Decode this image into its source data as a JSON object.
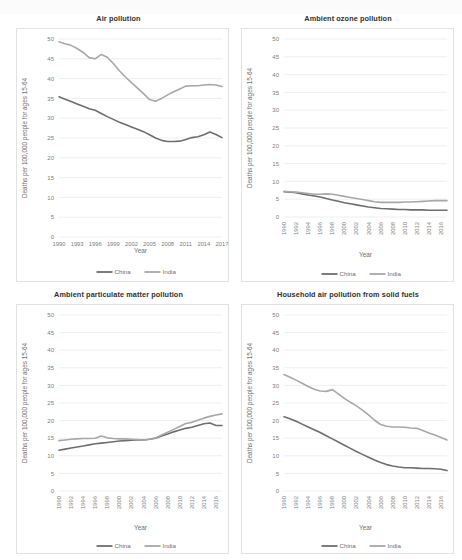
{
  "figure": {
    "legend": [
      {
        "label": "China",
        "color": "#6e6e6e"
      },
      {
        "label": "India",
        "color": "#a8a8a8"
      }
    ],
    "y_axis_title": "Deaths per 100,000 people for ages 15-64",
    "x_axis_title": "Year",
    "y_ticks": [
      "0",
      "5",
      "10",
      "15",
      "20",
      "25",
      "30",
      "35",
      "40",
      "45",
      "50"
    ]
  },
  "chart_data": [
    {
      "type": "line",
      "title": "Air pollution",
      "xlabel": "Year",
      "ylabel": "Deaths per 100,000 people for ages 15-64",
      "ylim": [
        0,
        50
      ],
      "grid": true,
      "legend_position": "bottom",
      "tick_labels": [
        "1990",
        "1993",
        "1996",
        "1999",
        "2002",
        "2005",
        "2008",
        "2011",
        "2014",
        "2017"
      ],
      "tick_rotation": 0,
      "x": [
        1990,
        1991,
        1992,
        1993,
        1994,
        1995,
        1996,
        1997,
        1998,
        1999,
        2000,
        2001,
        2002,
        2003,
        2004,
        2005,
        2006,
        2007,
        2008,
        2009,
        2010,
        2011,
        2012,
        2013,
        2014,
        2015,
        2016,
        2017
      ],
      "series": [
        {
          "name": "China",
          "color": "#6e6e6e",
          "values": [
            35.4,
            34.8,
            34.2,
            33.6,
            33.0,
            32.4,
            32.0,
            31.2,
            30.4,
            29.7,
            29.0,
            28.4,
            27.8,
            27.2,
            26.6,
            25.8,
            25.0,
            24.4,
            24.1,
            24.1,
            24.2,
            24.6,
            25.1,
            25.3,
            25.8,
            26.5,
            25.9,
            25.1
          ]
        },
        {
          "name": "India",
          "color": "#a8a8a8",
          "values": [
            49.3,
            48.8,
            48.4,
            47.6,
            46.6,
            45.3,
            45.0,
            46.1,
            45.4,
            43.8,
            42.0,
            40.4,
            39.0,
            37.6,
            36.2,
            34.7,
            34.3,
            35.0,
            35.9,
            36.7,
            37.4,
            38.1,
            38.2,
            38.2,
            38.4,
            38.5,
            38.4,
            38.0
          ]
        }
      ]
    },
    {
      "type": "line",
      "title": "Ambient ozone pollution",
      "xlabel": "Year",
      "ylabel": "Deaths per 100,000 people for ages 15-64",
      "ylim": [
        0,
        50
      ],
      "grid": true,
      "legend_position": "bottom",
      "tick_labels": [
        "1990",
        "1992",
        "1994",
        "1996",
        "1998",
        "2000",
        "2002",
        "2004",
        "2006",
        "2008",
        "2010",
        "2012",
        "2014",
        "2016"
      ],
      "tick_rotation": 90,
      "x": [
        1990,
        1991,
        1992,
        1993,
        1994,
        1995,
        1996,
        1997,
        1998,
        1999,
        2000,
        2001,
        2002,
        2003,
        2004,
        2005,
        2006,
        2007,
        2008,
        2009,
        2010,
        2011,
        2012,
        2013,
        2014,
        2015,
        2016,
        2017
      ],
      "series": [
        {
          "name": "China",
          "color": "#6e6e6e",
          "values": [
            7.1,
            7.0,
            6.8,
            6.5,
            6.2,
            5.9,
            5.6,
            5.2,
            4.8,
            4.4,
            4.0,
            3.7,
            3.4,
            3.1,
            2.8,
            2.6,
            2.4,
            2.3,
            2.2,
            2.1,
            2.1,
            2.0,
            2.0,
            2.0,
            1.9,
            1.9,
            1.9,
            1.9
          ]
        },
        {
          "name": "India",
          "color": "#a8a8a8",
          "values": [
            7.2,
            7.1,
            7.0,
            6.8,
            6.6,
            6.4,
            6.4,
            6.5,
            6.4,
            6.1,
            5.8,
            5.5,
            5.2,
            4.9,
            4.6,
            4.3,
            4.1,
            4.1,
            4.1,
            4.1,
            4.2,
            4.2,
            4.3,
            4.4,
            4.5,
            4.6,
            4.6,
            4.6
          ]
        }
      ]
    },
    {
      "type": "line",
      "title": "Ambient particulate matter pollution",
      "xlabel": "Year",
      "ylabel": "Deaths per 100,000 people for ages 15-64",
      "ylim": [
        0,
        50
      ],
      "grid": true,
      "legend_position": "bottom",
      "tick_labels": [
        "1990",
        "1992",
        "1994",
        "1996",
        "1998",
        "2000",
        "2002",
        "2004",
        "2006",
        "2008",
        "2010",
        "2012",
        "2014",
        "2016"
      ],
      "tick_rotation": 90,
      "x": [
        1990,
        1991,
        1992,
        1993,
        1994,
        1995,
        1996,
        1997,
        1998,
        1999,
        2000,
        2001,
        2002,
        2003,
        2004,
        2005,
        2006,
        2007,
        2008,
        2009,
        2010,
        2011,
        2012,
        2013,
        2014,
        2015,
        2016,
        2017
      ],
      "series": [
        {
          "name": "China",
          "color": "#6e6e6e",
          "values": [
            11.6,
            11.9,
            12.2,
            12.5,
            12.8,
            13.1,
            13.4,
            13.6,
            13.8,
            14.0,
            14.2,
            14.3,
            14.4,
            14.5,
            14.5,
            14.7,
            15.0,
            15.6,
            16.2,
            16.8,
            17.3,
            17.8,
            18.1,
            18.6,
            19.1,
            19.3,
            18.6,
            18.6
          ]
        },
        {
          "name": "India",
          "color": "#a8a8a8",
          "values": [
            14.3,
            14.5,
            14.7,
            14.8,
            14.9,
            14.9,
            15.0,
            15.6,
            15.1,
            14.9,
            14.8,
            14.8,
            14.7,
            14.6,
            14.5,
            14.7,
            15.1,
            15.9,
            16.7,
            17.5,
            18.3,
            19.2,
            19.5,
            20.1,
            20.7,
            21.2,
            21.6,
            21.9
          ]
        }
      ]
    },
    {
      "type": "line",
      "title": "Household air pollution from solid fuels",
      "xlabel": "Year",
      "ylabel": "Deaths per 100,000 people for ages 15-64",
      "ylim": [
        0,
        50
      ],
      "grid": true,
      "legend_position": "bottom",
      "tick_labels": [
        "1990",
        "1992",
        "1994",
        "1996",
        "1998",
        "2000",
        "2002",
        "2004",
        "2006",
        "2008",
        "2010",
        "2012",
        "2014",
        "2016"
      ],
      "tick_rotation": 90,
      "x": [
        1990,
        1991,
        1992,
        1993,
        1994,
        1995,
        1996,
        1997,
        1998,
        1999,
        2000,
        2001,
        2002,
        2003,
        2004,
        2005,
        2006,
        2007,
        2008,
        2009,
        2010,
        2011,
        2012,
        2013,
        2014,
        2015,
        2016,
        2017
      ],
      "series": [
        {
          "name": "China",
          "color": "#6e6e6e",
          "values": [
            21.1,
            20.5,
            19.8,
            19.0,
            18.2,
            17.4,
            16.6,
            15.7,
            14.8,
            13.9,
            13.0,
            12.1,
            11.2,
            10.4,
            9.6,
            8.8,
            8.1,
            7.5,
            7.1,
            6.8,
            6.6,
            6.6,
            6.5,
            6.4,
            6.4,
            6.3,
            6.2,
            5.8
          ]
        },
        {
          "name": "India",
          "color": "#a8a8a8",
          "values": [
            33.1,
            32.3,
            31.5,
            30.6,
            29.7,
            28.9,
            28.4,
            28.3,
            28.8,
            27.6,
            26.3,
            25.2,
            24.2,
            23.0,
            21.6,
            20.1,
            18.9,
            18.4,
            18.2,
            18.2,
            18.1,
            17.9,
            17.8,
            17.2,
            16.5,
            15.9,
            15.2,
            14.5
          ]
        }
      ]
    }
  ]
}
